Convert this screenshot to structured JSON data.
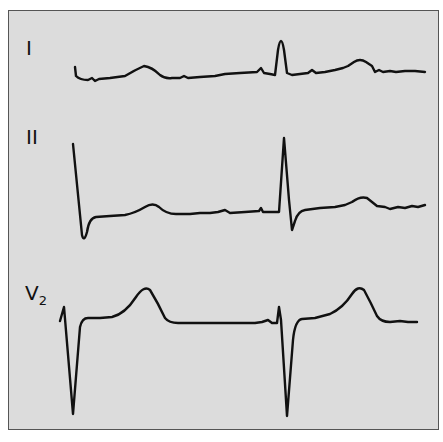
{
  "figure": {
    "title": "",
    "background_color": "#dcdcdc",
    "trace_color": "#111111",
    "leads": [
      {
        "id": "I",
        "label": "I",
        "subscript": ""
      },
      {
        "id": "II",
        "label": "II",
        "subscript": ""
      },
      {
        "id": "V2",
        "label": "V",
        "subscript": "2"
      }
    ]
  }
}
